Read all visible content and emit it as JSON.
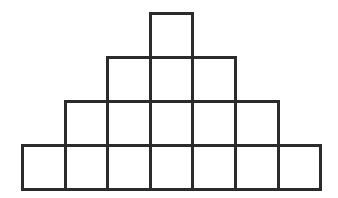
{
  "diagram": {
    "type": "square-pyramid",
    "rows": [
      1,
      3,
      5,
      7
    ],
    "total_squares": 16,
    "line_color": "#2b2b2b",
    "background": "#ffffff"
  },
  "layout": {
    "origin_x": 21,
    "bottom_y": 188,
    "cell_w": 42.6,
    "cell_h": 44,
    "border": 3
  }
}
